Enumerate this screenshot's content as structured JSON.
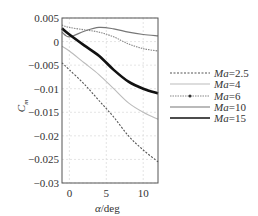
{
  "chart_data": {
    "type": "line",
    "title": "",
    "xlabel": "α/deg",
    "ylabel": "C_m",
    "xlim": [
      -1,
      12
    ],
    "ylim": [
      -0.03,
      0.005
    ],
    "xticks": [
      0,
      5,
      10
    ],
    "yticks": [
      0.005,
      0,
      -0.005,
      -0.01,
      -0.015,
      -0.02,
      -0.025,
      -0.03
    ],
    "ytick_labels": [
      "0.005",
      "0",
      "−0.005",
      "−0.01",
      "−0.015",
      "−0.02",
      "−0.025",
      "−0.03"
    ],
    "grid": true,
    "legend_position": "right-outside",
    "x": [
      -1,
      0,
      2,
      4,
      6,
      8,
      10,
      12
    ],
    "series": [
      {
        "name": "Ma=2.5",
        "style": "dashed-dark",
        "values": [
          -0.0045,
          -0.006,
          -0.009,
          -0.0125,
          -0.016,
          -0.02,
          -0.023,
          -0.0255
        ]
      },
      {
        "name": "Ma=4",
        "style": "dotted-light",
        "values": [
          -0.001,
          -0.002,
          -0.0045,
          -0.007,
          -0.01,
          -0.013,
          -0.015,
          -0.0165
        ]
      },
      {
        "name": "Ma=6",
        "style": "dash-dot-gray",
        "values": [
          0.0035,
          0.003,
          0.0025,
          0.002,
          0.001,
          -0.0005,
          -0.0015,
          -0.002
        ]
      },
      {
        "name": "Ma=10",
        "style": "solid-gray",
        "values": [
          0.002,
          0.001,
          0.0022,
          0.003,
          0.0027,
          0.002,
          0.0015,
          0.0012
        ]
      },
      {
        "name": "Ma=15",
        "style": "solid-thick-black",
        "values": [
          0.0028,
          0.0015,
          -0.0008,
          -0.003,
          -0.006,
          -0.0085,
          -0.01,
          -0.011
        ]
      }
    ]
  },
  "axes": {
    "xlabel_alpha": "α",
    "xlabel_unit": "/deg",
    "ylabel_main": "C",
    "ylabel_sub": "m"
  },
  "legend": [
    {
      "prefix": "Ma",
      "value": "=2.5"
    },
    {
      "prefix": "Ma",
      "value": "=4"
    },
    {
      "prefix": "Ma",
      "value": "=6"
    },
    {
      "prefix": "Ma",
      "value": "=10"
    },
    {
      "prefix": "Ma",
      "value": "=15"
    }
  ]
}
